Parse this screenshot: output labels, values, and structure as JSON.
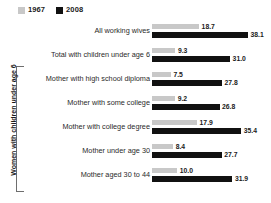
{
  "legend": {
    "items": [
      {
        "label": "1967",
        "color": "#c8c8c8",
        "icon": "square-swatch"
      },
      {
        "label": "2008",
        "color": "#111111",
        "icon": "square-swatch"
      }
    ]
  },
  "group_axis": {
    "label": "Women with children under age 6"
  },
  "chart_data": {
    "type": "bar",
    "orientation": "horizontal",
    "title": "",
    "subtitle": "",
    "xlabel": "",
    "ylabel": "Women with children under age 6",
    "xlim": [
      0,
      38.1
    ],
    "grid": false,
    "legend_position": "top-left",
    "categories": [
      "All working wives",
      "Total with children under age 6",
      "Mother with high school diploma",
      "Mother with some college",
      "Mother with college degree",
      "Mother under age 30",
      "Mother aged 30 to 44"
    ],
    "series": [
      {
        "name": "1967",
        "color": "#c8c8c8",
        "values": [
          18.7,
          9.3,
          7.5,
          9.2,
          17.9,
          8.4,
          10.0
        ],
        "labels": [
          "18.7",
          "9.3",
          "7.5",
          "9.2",
          "17.9",
          "8.4",
          "10.0"
        ]
      },
      {
        "name": "2008",
        "color": "#111111",
        "values": [
          38.1,
          31.0,
          27.8,
          26.8,
          35.4,
          27.7,
          31.9
        ],
        "labels": [
          "38.1",
          "31.0",
          "27.8",
          "26.8",
          "35.4",
          "27.7",
          "31.9"
        ]
      }
    ],
    "bracket_categories": [
      "Mother with high school diploma",
      "Mother with some college",
      "Mother with college degree",
      "Mother under age 30",
      "Mother aged 30 to 44"
    ]
  }
}
